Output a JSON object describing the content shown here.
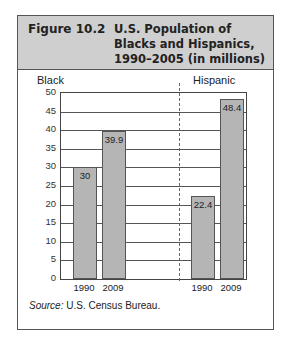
{
  "figure": {
    "number": "Figure 10.2",
    "title": "U.S. Population of Blacks and Hispanics, 1990–2005 (in millions)",
    "title_lines": [
      "U.S. Population of",
      "Blacks and Hispanics,",
      "1990–2005 (in millions)"
    ],
    "source_label": "Source:",
    "source_text": " U.S. Census Bureau."
  },
  "chart_data": {
    "type": "bar",
    "title": "U.S. Population of Blacks and Hispanics, 1990–2005 (in millions)",
    "xlabel": "",
    "ylabel": "",
    "ylim": [
      0,
      50
    ],
    "yticks": [
      0,
      5,
      10,
      15,
      20,
      25,
      30,
      35,
      40,
      45,
      50
    ],
    "grid": true,
    "groups": [
      {
        "name": "Black",
        "categories": [
          "1990",
          "2009"
        ],
        "values": [
          30,
          39.9
        ],
        "labels": [
          "30",
          "39.9"
        ]
      },
      {
        "name": "Hispanic",
        "categories": [
          "1990",
          "2009"
        ],
        "values": [
          22.4,
          48.4
        ],
        "labels": [
          "22.4",
          "48.4"
        ]
      }
    ],
    "bar_color": "#b5b5b5",
    "header_color": "#cfcfcf"
  }
}
